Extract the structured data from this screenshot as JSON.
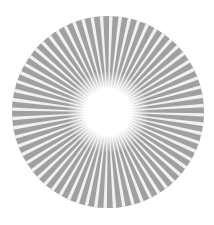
{
  "graphic": {
    "type": "starburst",
    "description": "Gray disc with white radial rays emanating from a glowing white center",
    "center": [
      108,
      112
    ],
    "radius": 96,
    "ray_count": 64,
    "inner_glow_radius": 26,
    "colors": {
      "disc": "#a0a0a0",
      "rays": "#ffffff",
      "center": "#ffffff",
      "background": "#ffffff"
    }
  }
}
